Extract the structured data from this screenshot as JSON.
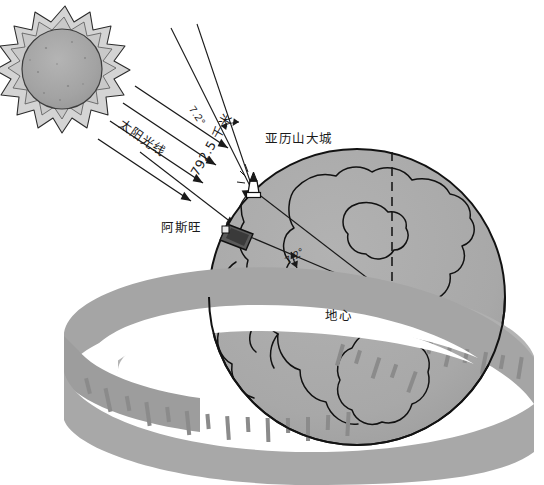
{
  "figure": {
    "canvas": {
      "width": 544,
      "height": 485
    },
    "background_color": "#ffffff"
  },
  "labels": {
    "sun_rays": "太阳光线",
    "angle_top": "7.2°",
    "distance": "792.5 千米",
    "alexandria": "亚历山大城",
    "aswan": "阿斯旺",
    "angle_center": "7.2°",
    "earth_center": "地心",
    "caption": ""
  },
  "measurements": {
    "shadow_angle_deg": 7.2,
    "central_angle_deg": 7.2,
    "arc_distance_km": 792.5,
    "arc_distance_unit": "千米"
  },
  "colors": {
    "earth_fill": "#a9a9a9",
    "earth_outline": "#141414",
    "sun_outer": "#d2d2d2",
    "sun_mid": "#c2c2c2",
    "sun_core": "#a0a0a0",
    "tape_fill": "#a3a3a3",
    "tape_fill_light": "#b5b5b5",
    "tape_tick": "#8c8c8c",
    "line_color": "#1a1a1a",
    "text_color": "#1a1a1a",
    "marker_dark": "#565656"
  },
  "elements": {
    "sun": "sun-illustration",
    "sun_ray_count": 4,
    "globe": "earth-globe",
    "tape": "measuring-tape",
    "alexandria_marker": "obelisk-marker",
    "aswan_marker": "well-shaft-marker",
    "center_dot": "earth-center-dot",
    "axis_vertical": "dashed-vertical-axis",
    "axis_horizontal": "dashed-horizontal-axis"
  }
}
